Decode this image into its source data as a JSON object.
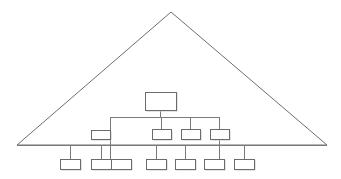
{
  "diagram": {
    "type": "tree-diagram",
    "background_color": "#ffffff",
    "line_color": "#6e6e6e",
    "box_fill_color": "#ffffff",
    "box_stroke_color": "#6b6b6b",
    "shadow_color": "#c9c9c9",
    "boundary": {
      "name": "triangle-boundary",
      "shape": "triangle",
      "apex": {
        "x": 171,
        "y": 12
      },
      "base_left": {
        "x": 17,
        "y": 145
      },
      "base_right": {
        "x": 327,
        "y": 145
      },
      "label": ""
    },
    "baseline": {
      "name": "baseline-bus",
      "y": 145,
      "x_start": 17,
      "x_end": 327,
      "label": ""
    },
    "bus": {
      "name": "distribution-bus",
      "y": 117,
      "x_start": 110,
      "x_end": 219,
      "label": ""
    },
    "levels": [
      {
        "name": "level-root",
        "label": "",
        "nodes": [
          {
            "id": "root",
            "label": "",
            "x": 145,
            "y": 92,
            "w": 31,
            "h": 18
          }
        ]
      },
      {
        "name": "level-middle",
        "label": "",
        "nodes": [
          {
            "id": "mid-1",
            "label": "",
            "x": 91,
            "y": 130,
            "w": 19,
            "h": 9
          },
          {
            "id": "mid-2",
            "label": "",
            "x": 152,
            "y": 129,
            "w": 19,
            "h": 10
          },
          {
            "id": "mid-3",
            "label": "",
            "x": 181,
            "y": 129,
            "w": 19,
            "h": 10
          },
          {
            "id": "mid-4",
            "label": "",
            "x": 210,
            "y": 129,
            "w": 19,
            "h": 10
          }
        ]
      },
      {
        "name": "level-bottom",
        "label": "",
        "nodes": [
          {
            "id": "leaf-1",
            "label": "",
            "x": 60,
            "y": 159,
            "w": 20,
            "h": 10
          },
          {
            "id": "leaf-2",
            "label": "",
            "x": 91,
            "y": 159,
            "w": 20,
            "h": 10
          },
          {
            "id": "leaf-3",
            "label": "",
            "x": 111,
            "y": 159,
            "w": 20,
            "h": 10
          },
          {
            "id": "leaf-4",
            "label": "",
            "x": 146,
            "y": 159,
            "w": 20,
            "h": 10
          },
          {
            "id": "leaf-5",
            "label": "",
            "x": 175,
            "y": 159,
            "w": 20,
            "h": 10
          },
          {
            "id": "leaf-6",
            "label": "",
            "x": 204,
            "y": 159,
            "w": 20,
            "h": 10
          },
          {
            "id": "leaf-7",
            "label": "",
            "x": 234,
            "y": 159,
            "w": 20,
            "h": 10
          }
        ]
      }
    ],
    "connectors": [
      {
        "name": "root-to-bus",
        "points": "160.5,110 160.5,117"
      },
      {
        "name": "bus-horizontal",
        "points": "110,117 219,117"
      },
      {
        "name": "bus-left-drop",
        "points": "110.5,117 110.5,159"
      },
      {
        "name": "bus-mid2-drop",
        "points": "161.5,117 161.5,129"
      },
      {
        "name": "bus-mid3-drop",
        "points": "190.5,117 190.5,129"
      },
      {
        "name": "bus-mid4-drop",
        "points": "219.5,117 219.5,129"
      },
      {
        "name": "mid1-to-left-drop",
        "points": "110,134.5 91,134.5"
      },
      {
        "name": "mid4-through-baseline",
        "points": "219.5,139 219.5,159"
      },
      {
        "name": "baseline-horizontal",
        "points": "17,145 327,145"
      },
      {
        "name": "leaf1-riser",
        "points": "70.5,145 70.5,159"
      },
      {
        "name": "leaf2-riser",
        "points": "101.5,145 101.5,159"
      },
      {
        "name": "leaf4-riser",
        "points": "156.5,145 156.5,159"
      },
      {
        "name": "leaf5-riser",
        "points": "185.5,145 185.5,159"
      },
      {
        "name": "leaf7-riser",
        "points": "244.5,145 244.5,159"
      }
    ]
  }
}
